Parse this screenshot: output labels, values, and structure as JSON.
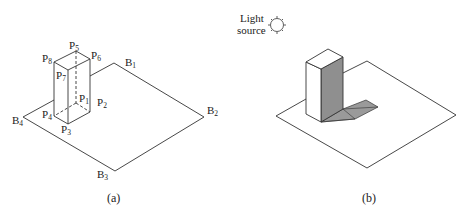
{
  "figure_a": {
    "caption": "(a)",
    "plane_labels": {
      "B1": "B",
      "B1s": "1",
      "B2": "B",
      "B2s": "2",
      "B3": "B",
      "B3s": "3",
      "B4": "B",
      "B4s": "4"
    },
    "box_labels": {
      "P1": "P",
      "P1s": "1",
      "P2": "P",
      "P2s": "2",
      "P3": "P",
      "P3s": "3",
      "P4": "P",
      "P4s": "4",
      "P5": "P",
      "P5s": "5",
      "P6": "P",
      "P6s": "6",
      "P7": "P",
      "P7s": "7",
      "P8": "P",
      "P8s": "8"
    }
  },
  "figure_b": {
    "caption": "(b)",
    "light_line1": "Light",
    "light_line2": "source",
    "shade_color": "#8f8f8f",
    "shadow_color": "#9a9a9a"
  }
}
